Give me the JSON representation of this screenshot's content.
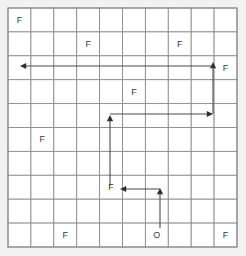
{
  "board": {
    "name": "frozen-lake-grid",
    "rows": 10,
    "cols": 10,
    "origin_x": 8,
    "origin_y": 8,
    "cell_w": 22.9,
    "cell_h": 23.9,
    "colors": {
      "page_background": "#f2f2f2",
      "cell_fill": "#ffffff",
      "grid_line": "#8d8d8d",
      "label_text": "#3a3a3a",
      "path_stroke": "#4a4a4a",
      "arrow_head": "#2e2e2e"
    }
  },
  "labels": [
    {
      "id": "label-r1c1",
      "text": "F",
      "row": 1,
      "col": 1
    },
    {
      "id": "label-r2c4",
      "text": "F",
      "row": 2,
      "col": 4
    },
    {
      "id": "label-r2c8",
      "text": "F",
      "row": 2,
      "col": 8
    },
    {
      "id": "label-r3c10",
      "text": "F",
      "row": 3,
      "col": 10
    },
    {
      "id": "label-r4c6",
      "text": "F",
      "row": 4,
      "col": 6
    },
    {
      "id": "label-r6c2",
      "text": "F",
      "row": 6,
      "col": 2
    },
    {
      "id": "label-r8c5",
      "text": "F",
      "row": 8,
      "col": 5
    },
    {
      "id": "label-r10c3",
      "text": "F",
      "row": 10,
      "col": 3
    },
    {
      "id": "label-r10c7",
      "text": "O",
      "row": 10,
      "col": 7
    },
    {
      "id": "label-r10c10",
      "text": "F",
      "row": 10,
      "col": 10
    }
  ],
  "path_segments": [
    {
      "id": "seg-start-up",
      "x1": 160,
      "y1": 228,
      "x2": 160,
      "y2": 190,
      "head": "up",
      "head_x": 160,
      "head_y": 188
    },
    {
      "id": "seg-left-to-f",
      "x1": 160,
      "y1": 189,
      "x2": 122,
      "y2": 189,
      "head": "left",
      "head_x": 120,
      "head_y": 189
    },
    {
      "id": "seg-mid-up",
      "x1": 110,
      "y1": 186,
      "x2": 110,
      "y2": 118,
      "head": "up",
      "head_x": 110,
      "head_y": 115
    },
    {
      "id": "seg-right-across",
      "x1": 110,
      "y1": 114,
      "x2": 210,
      "y2": 114,
      "head": "right",
      "head_x": 213,
      "head_y": 114
    },
    {
      "id": "seg-right-up",
      "x1": 213,
      "y1": 114,
      "x2": 213,
      "y2": 66,
      "head": "up",
      "head_x": 213,
      "head_y": 62
    },
    {
      "id": "seg-top-left-long",
      "x1": 213,
      "y1": 66,
      "x2": 24,
      "y2": 66,
      "head": "left",
      "head_x": 20,
      "head_y": 66
    }
  ],
  "path_summary": {
    "start_marker": "O",
    "goal_marker": "F",
    "segment_count": 6
  }
}
